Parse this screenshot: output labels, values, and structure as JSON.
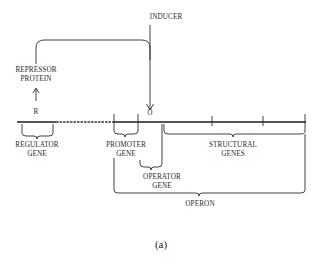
{
  "diagram": {
    "labels": {
      "inducer": "INDUCER",
      "repressor_line1": "REPRESSOR",
      "repressor_line2": "PROTEIN",
      "regulator_site": "R",
      "operator_site": "O",
      "regulator_line1": "REGULATOR",
      "regulator_line2": "GENE",
      "promoter_line1": "PROMOTER",
      "promoter_line2": "GENE",
      "operator_line1": "OPERATOR",
      "operator_line2": "GENE",
      "structural_line1": "STRUCTURAL",
      "structural_line2": "GENES",
      "operon": "OPERON"
    },
    "caption": "(a)",
    "colors": {
      "line": "#2c2c2c",
      "dna_strand": "#555555",
      "text": "#2a2a2a"
    }
  }
}
